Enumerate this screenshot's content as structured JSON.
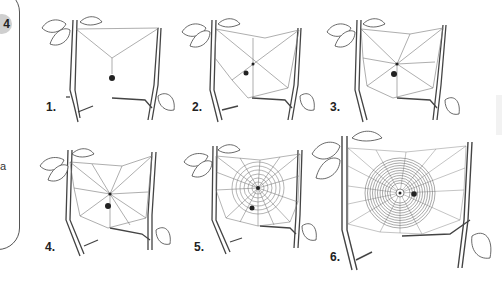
{
  "side_panel": {
    "badge": "4",
    "text_fragment": "a"
  },
  "figure": {
    "stages": [
      {
        "label": "1.",
        "description": "Bridge line and Y-shaped frame with spider hanging"
      },
      {
        "label": "2.",
        "description": "Frame threads and first radii"
      },
      {
        "label": "3.",
        "description": "More radii added; spider at hub"
      },
      {
        "label": "4.",
        "description": "Radii complete with frame"
      },
      {
        "label": "5.",
        "description": "Temporary spiral laid from hub outward"
      },
      {
        "label": "6.",
        "description": "Finished capture spiral, spider at hub"
      }
    ]
  }
}
